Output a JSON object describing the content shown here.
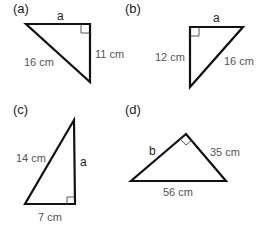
{
  "panels": [
    {
      "id": "a",
      "label": "(a)",
      "sides": {
        "top": "a",
        "right": "11 cm",
        "hypotenuse": "16 cm"
      }
    },
    {
      "id": "b",
      "label": "(b)",
      "sides": {
        "top": "a",
        "left": "12 cm",
        "hypotenuse": "16 cm"
      }
    },
    {
      "id": "c",
      "label": "(c)",
      "sides": {
        "hypotenuse": "14 cm",
        "right": "a",
        "bottom": "7 cm"
      }
    },
    {
      "id": "d",
      "label": "(d)",
      "sides": {
        "left": "b",
        "right": "35 cm",
        "bottom": "56 cm"
      }
    }
  ]
}
